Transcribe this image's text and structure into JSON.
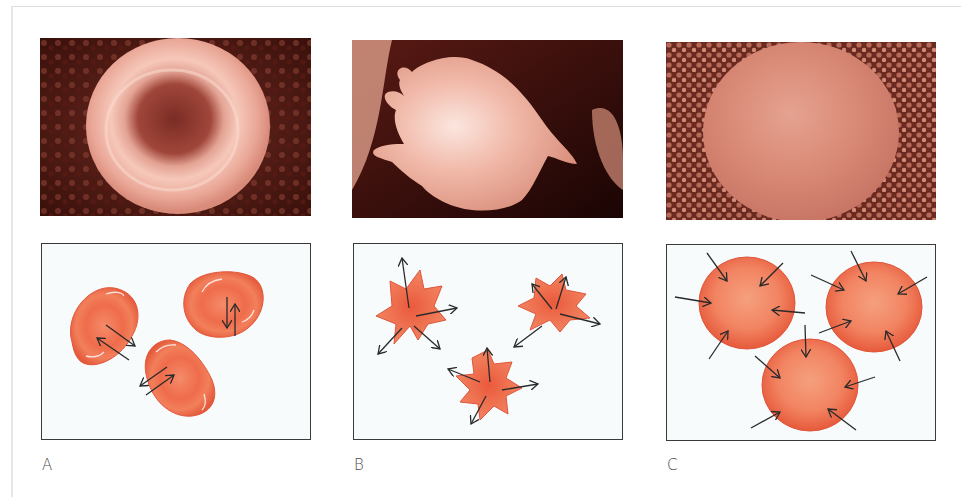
{
  "figure": {
    "panels": [
      {
        "id": "A",
        "label": "A",
        "photo_description": "Scanning electron micrograph of normal biconcave red blood cell",
        "diagram_description": "Three biconcave red cells with paired bidirectional arrows (equal water movement in and out)",
        "arrow_direction": "both"
      },
      {
        "id": "B",
        "label": "B",
        "photo_description": "Scanning electron micrograph of crenated (shrunken, spiky) red blood cell",
        "diagram_description": "Three crenated star-shaped cells with arrows pointing outward (water leaving cell)",
        "arrow_direction": "out"
      },
      {
        "id": "C",
        "label": "C",
        "photo_description": "Scanning electron micrograph of swollen spherical red blood cell",
        "diagram_description": "Three swollen round cells with arrows pointing inward (water entering cell)",
        "arrow_direction": "in"
      }
    ]
  },
  "colors": {
    "cell_fill": "#ee6a48",
    "cell_center": "#f08a66",
    "cell_edge": "#d8472c",
    "diagram_bg": "#f7fbfc",
    "diagram_border": "#3a3a3a",
    "arrow": "#2a2a2a",
    "photo_bg_dark": "#4a1510",
    "photo_cell": "#e7a18f",
    "label": "#4a4a4a"
  }
}
